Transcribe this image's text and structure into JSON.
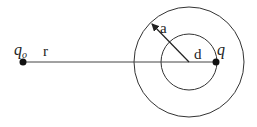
{
  "diagram": {
    "labels": {
      "source_charge": "q",
      "source_charge_sub": "o",
      "distance": "r",
      "radius": "a",
      "offset": "d",
      "charge": "q"
    },
    "colors": {
      "stroke": "#333333",
      "dot": "#111111",
      "background": "#ffffff"
    }
  }
}
